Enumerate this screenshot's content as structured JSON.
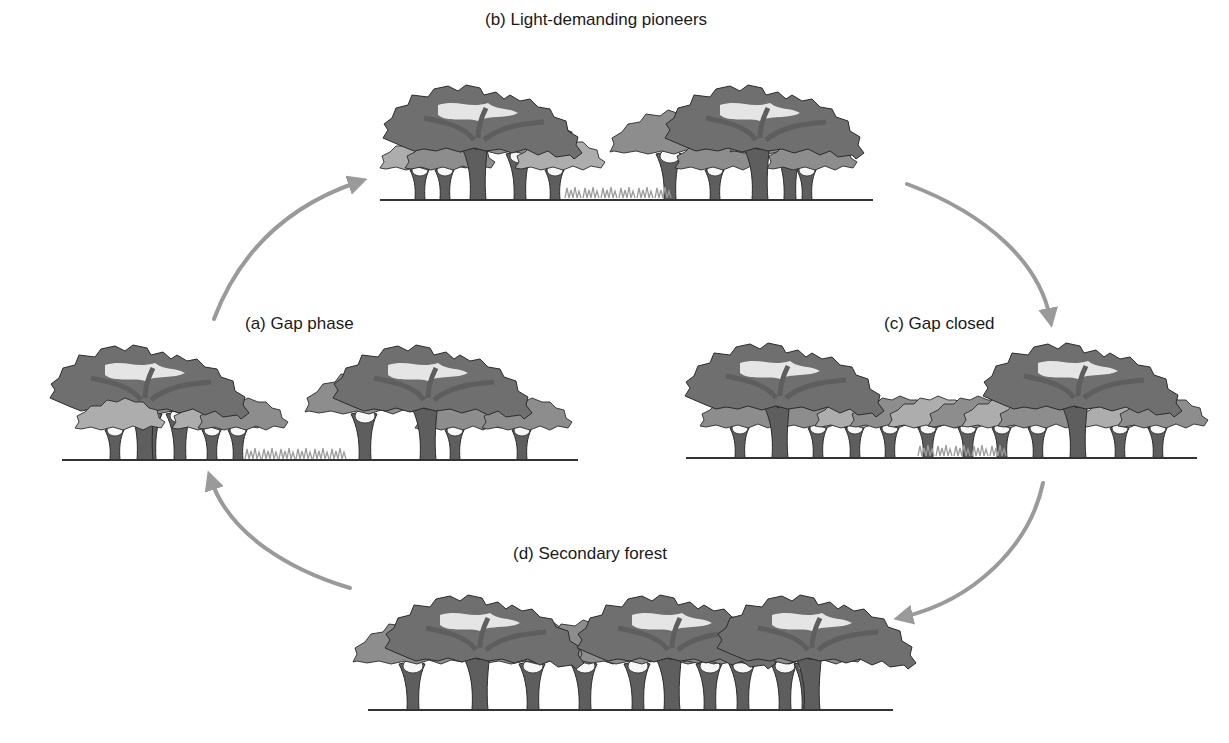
{
  "diagram": {
    "type": "cycle",
    "topic": "Forest gap dynamics",
    "stages": [
      {
        "id": "a",
        "label": "(a) Gap phase",
        "position": "left"
      },
      {
        "id": "b",
        "label": "(b) Light-demanding pioneers",
        "position": "top"
      },
      {
        "id": "c",
        "label": "(c) Gap closed",
        "position": "right"
      },
      {
        "id": "d",
        "label": "(d) Secondary forest",
        "position": "bottom"
      }
    ],
    "arrows": [
      {
        "from": "a",
        "to": "b"
      },
      {
        "from": "b",
        "to": "c"
      },
      {
        "from": "c",
        "to": "d"
      },
      {
        "from": "d",
        "to": "a"
      }
    ],
    "colors": {
      "canopy_dark": "#6f6f6f",
      "canopy_mid": "#8d8d8d",
      "canopy_light": "#adadad",
      "trunk": "#5e5e5e",
      "outline": "#2b2b2b",
      "arrow": "#9a9a9a",
      "ground": "#333333",
      "grass": "#9c9c9c"
    }
  }
}
